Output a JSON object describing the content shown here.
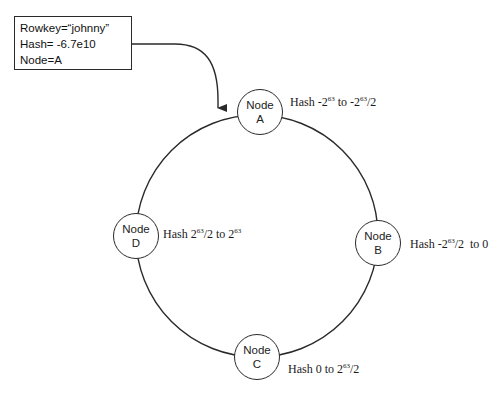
{
  "info_box": {
    "lines": [
      "Rowkey=“johnny”",
      "Hash= -6.7e10",
      "Node=A"
    ]
  },
  "ring": {
    "center": [
      257,
      236
    ],
    "radius": 121,
    "stroke": "#2a2a2a"
  },
  "nodes": [
    {
      "id": "A",
      "line1": "Node",
      "line2": "A",
      "center": [
        260,
        112
      ],
      "hash": {
        "prefix": "Hash -2",
        "exp1": "63",
        "mid": " to -2",
        "exp2": "63",
        "suffix": "/2"
      }
    },
    {
      "id": "B",
      "line1": "Node",
      "line2": "B",
      "center": [
        378,
        243
      ],
      "hash": {
        "prefix": "Hash -2",
        "exp1": "63",
        "mid": "/2  to 0",
        "exp2": "",
        "suffix": ""
      }
    },
    {
      "id": "C",
      "line1": "Node",
      "line2": "C",
      "center": [
        257,
        357
      ],
      "hash": {
        "prefix": "Hash 0 to 2",
        "exp1": "63",
        "mid": "/2",
        "exp2": "",
        "suffix": ""
      }
    },
    {
      "id": "D",
      "line1": "Node",
      "line2": "D",
      "center": [
        136,
        236
      ],
      "hash": {
        "prefix": "Hash 2",
        "exp1": "63",
        "mid": "/2 to 2",
        "exp2": "63",
        "suffix": ""
      }
    }
  ],
  "arrow": {
    "from": "info_box",
    "to": "ring-near-node-A",
    "stroke": "#2a2a2a"
  }
}
